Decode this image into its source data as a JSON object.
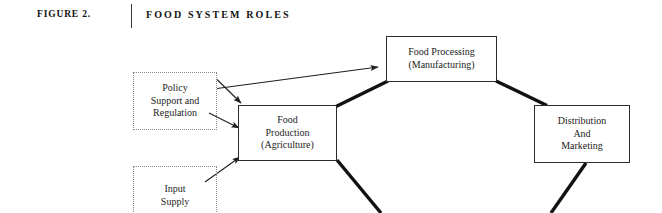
{
  "header": {
    "figure_label": "FIGURE 2.",
    "title": "FOOD SYSTEM ROLES",
    "rule": "vertical-divider"
  },
  "colors": {
    "background": "#ffffff",
    "text": "#1c1c1c",
    "solid_border": "#2b2b2b",
    "dotted_border": "#8a8a8a",
    "thin_edge": "#1f1f1f",
    "thick_edge": "#111111"
  },
  "diagram": {
    "type": "flow-diagram",
    "nodes": [
      {
        "id": "food-processing",
        "label": "Food Processing\n(Manufacturing)",
        "style": "solid",
        "x": 386,
        "y": 36,
        "w": 111,
        "h": 46
      },
      {
        "id": "food-production",
        "label": "Food\nProduction\n(Agriculture)",
        "style": "solid",
        "x": 238,
        "y": 105,
        "w": 99,
        "h": 56
      },
      {
        "id": "distribution",
        "label": "Distribution\nAnd\nMarketing",
        "style": "solid",
        "x": 534,
        "y": 105,
        "w": 96,
        "h": 58
      },
      {
        "id": "policy",
        "label": "Policy\nSupport and\nRegulation",
        "style": "dotted",
        "x": 133,
        "y": 72,
        "w": 84,
        "h": 58
      },
      {
        "id": "input-supply",
        "label": "Input\nSupply",
        "style": "dotted",
        "x": 133,
        "y": 166,
        "w": 84,
        "h": 60
      }
    ],
    "edges": [
      {
        "id": "policy-to-food-processing",
        "from": "policy",
        "to": "food-processing",
        "weight": "thin",
        "arrow": true
      },
      {
        "id": "policy-to-food-production-top",
        "from": "policy",
        "to": "food-production",
        "weight": "thin",
        "arrow": true
      },
      {
        "id": "policy-to-food-production-side",
        "from": "policy",
        "to": "food-production",
        "weight": "thin",
        "arrow": true
      },
      {
        "id": "input-supply-to-food-production",
        "from": "input-supply",
        "to": "food-production",
        "weight": "thin",
        "arrow": true
      },
      {
        "id": "food-production-to-food-processing",
        "from": "food-production",
        "to": "food-processing",
        "weight": "thick",
        "arrow": false
      },
      {
        "id": "food-processing-to-distribution",
        "from": "food-processing",
        "to": "distribution",
        "weight": "thick",
        "arrow": false
      },
      {
        "id": "food-production-downstream",
        "from": "food-production",
        "to": "offscreen-below",
        "weight": "thick",
        "arrow": false
      },
      {
        "id": "distribution-downstream",
        "from": "distribution",
        "to": "offscreen-below",
        "weight": "thick",
        "arrow": false
      }
    ]
  }
}
